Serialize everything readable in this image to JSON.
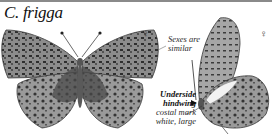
{
  "header": {
    "species": "C. frigga"
  },
  "specimens": [
    {
      "view": "upperside",
      "sex_symbol": "♀"
    },
    {
      "view": "underside",
      "sex_symbol": "♀"
    }
  ],
  "annotations": {
    "sexes": {
      "line1": "Sexes are",
      "line2": "similar"
    },
    "underside": {
      "heading1": "Underside",
      "heading2": "hindwing",
      "line1": "costal mark",
      "line2": "white, large"
    }
  },
  "colors": {
    "rule": "#8a8a8a",
    "wing_dark": "#3a3a3a",
    "wing_mid": "#7a7a7a",
    "wing_light": "#b5b5b5"
  }
}
